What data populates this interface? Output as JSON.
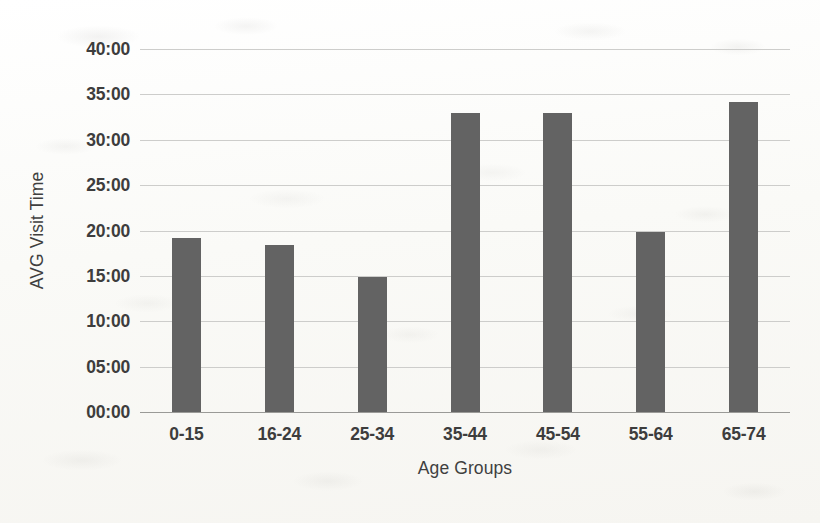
{
  "chart_data": {
    "type": "bar",
    "title": "",
    "xlabel": "Age Groups",
    "ylabel": "AVG Visit Time",
    "categories": [
      "0-15",
      "16-24",
      "25-34",
      "35-44",
      "45-54",
      "55-64",
      "65-74"
    ],
    "values": [
      19.2,
      18.4,
      14.9,
      33.0,
      32.9,
      19.8,
      34.2
    ],
    "value_labels": [
      "19:12",
      "18:24",
      "14:54",
      "33:00",
      "32:54",
      "19:48",
      "34:12"
    ],
    "ylim": [
      0,
      40
    ],
    "ytick_values": [
      40,
      35,
      30,
      25,
      20,
      15,
      10,
      5,
      0
    ],
    "ytick_labels": [
      "40:00",
      "35:00",
      "30:00",
      "25:00",
      "20:00",
      "15:00",
      "10:00",
      "05:00",
      "00:00"
    ],
    "units": "mm:ss",
    "grid": true,
    "legend": false,
    "series_color": "#636363",
    "gridline_color": "#cdcdcb",
    "axis_color": "#9a9a97",
    "label_color": "#3d3d3d",
    "background_color": "#fbfbf9"
  }
}
